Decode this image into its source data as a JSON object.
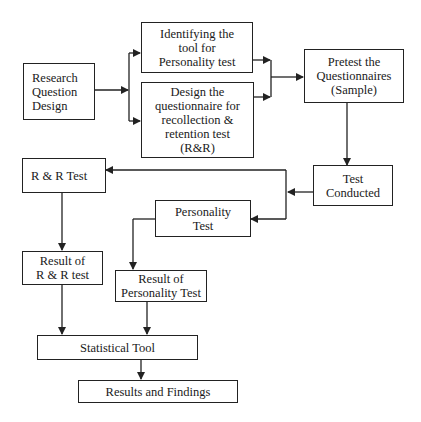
{
  "diagram": {
    "type": "flowchart",
    "nodes": {
      "research": {
        "label": "Research\nQuestion\nDesign"
      },
      "identify": {
        "label": "Identifying the\ntool for\nPersonality test"
      },
      "design": {
        "label": "Design the\nquestionnaire for\nrecollection &\nretention test\n(R&R)"
      },
      "pretest": {
        "label": "Pretest the\nQuestionnaires\n(Sample)"
      },
      "conducted": {
        "label": "Test\nConducted"
      },
      "rr_test": {
        "label": "R & R Test"
      },
      "personality": {
        "label": "Personality\nTest"
      },
      "rr_result": {
        "label": "Result of\nR & R test"
      },
      "personality_result": {
        "label": "Result of\nPersonality Test"
      },
      "statistical": {
        "label": "Statistical Tool"
      },
      "findings": {
        "label": "Results and Findings"
      }
    },
    "edges": [
      [
        "research",
        "identify"
      ],
      [
        "research",
        "design"
      ],
      [
        "identify",
        "pretest"
      ],
      [
        "design",
        "pretest"
      ],
      [
        "pretest",
        "conducted"
      ],
      [
        "conducted",
        "rr_test"
      ],
      [
        "conducted",
        "personality"
      ],
      [
        "rr_test",
        "rr_result"
      ],
      [
        "personality",
        "personality_result"
      ],
      [
        "rr_result",
        "statistical"
      ],
      [
        "personality_result",
        "statistical"
      ],
      [
        "statistical",
        "findings"
      ]
    ],
    "colors": {
      "line": "#222222",
      "background": "#ffffff"
    }
  }
}
